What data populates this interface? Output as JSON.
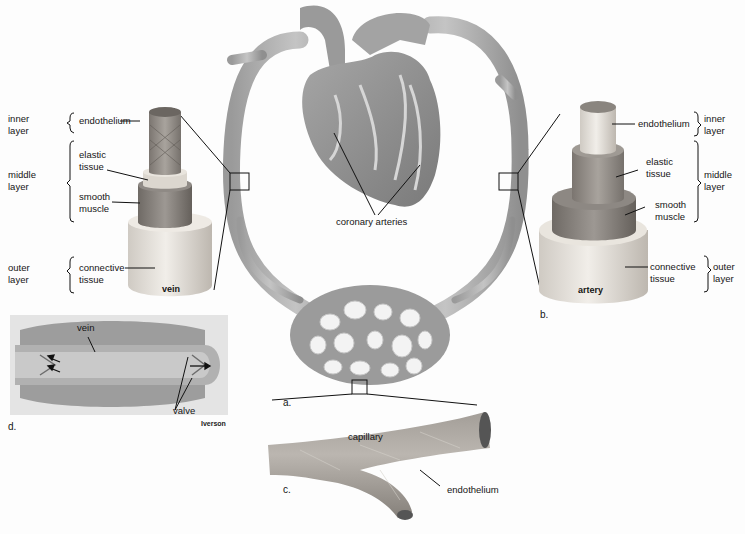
{
  "figure": {
    "panels": {
      "a": {
        "letter": "a.",
        "labels": {
          "coronary": "coronary arteries"
        }
      },
      "b": {
        "letter": "b.",
        "name": "artery",
        "layers": {
          "inner": "inner\nlayer",
          "middle": "middle\nlayer",
          "outer": "outer\nlayer"
        },
        "tissues": {
          "endothelium": "endothelium",
          "elastic": "elastic\ntissue",
          "smooth": "smooth\nmuscle",
          "connective": "connective\ntissue"
        }
      },
      "c": {
        "letter": "c.",
        "name": "capillary",
        "endothelium": "endothelium"
      },
      "d": {
        "letter": "d.",
        "vein": "vein",
        "valve": "valve",
        "credit": "Iverson"
      },
      "vein": {
        "name": "vein",
        "layers": {
          "inner": "inner\nlayer",
          "middle": "middle\nlayer",
          "outer": "outer\nlayer"
        },
        "tissues": {
          "endothelium": "endothelium",
          "elastic": "elastic\ntissue",
          "smooth": "smooth\nmuscle",
          "connective": "connective\ntissue"
        }
      }
    },
    "colors": {
      "vessel": "#a9a9a9",
      "vessel_dark": "#8c8c8c",
      "heart": "#8f8f8f",
      "tissue_light": "#e6e2dc",
      "muscle": "#8a8580",
      "line": "#111111"
    }
  }
}
